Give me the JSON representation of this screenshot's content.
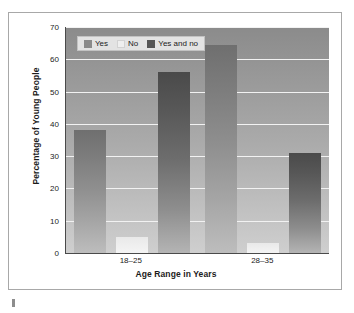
{
  "chart_data": {
    "type": "bar",
    "title": "",
    "subtitle": "",
    "xlabel": "Age Range in Years",
    "ylabel": "Percentage of Young People",
    "categories": [
      "18–25",
      "28–35"
    ],
    "series": [
      {
        "name": "Yes",
        "values": [
          38,
          64.5
        ],
        "color": "#8a8a8a"
      },
      {
        "name": "No",
        "values": [
          5,
          3
        ],
        "color": "#efefef"
      },
      {
        "name": "Yes and no",
        "values": [
          56,
          31
        ],
        "color": "#555555"
      }
    ],
    "ylim": [
      0,
      70
    ],
    "ytick_step": 10,
    "yticks": [
      0,
      10,
      20,
      30,
      40,
      50,
      60,
      70
    ],
    "ytick_labels": [
      "0",
      "10",
      "20",
      "30",
      "40",
      "50",
      "60",
      "70"
    ],
    "grid": true,
    "grid_axis": "y",
    "grid_color": "#f2f2f2",
    "legend": true,
    "legend_position": "top-left",
    "orientation": "vertical",
    "plot_background": "gray-gradient",
    "bar_fill": "vertical-gradient"
  },
  "figure": {
    "card_border_color": "#a8a8a8",
    "card_background": "#ffffff",
    "axis_line_color": "#4a4a4a",
    "artifact_mark": ""
  }
}
